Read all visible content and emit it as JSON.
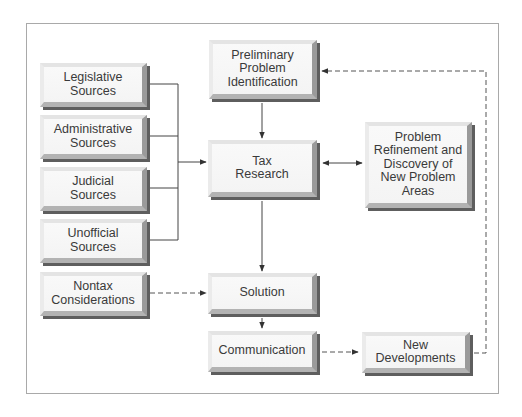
{
  "diagram": {
    "title": "",
    "nodes": {
      "legislative": {
        "label": "Legislative\nSources"
      },
      "administrative": {
        "label": "Administrative\nSources"
      },
      "judicial": {
        "label": "Judicial\nSources"
      },
      "unofficial": {
        "label": "Unofficial\nSources"
      },
      "nontax": {
        "label": "Nontax\nConsiderations"
      },
      "preliminary": {
        "label": "Preliminary\nProblem\nIdentification"
      },
      "tax_research": {
        "label": "Tax\nResearch"
      },
      "refinement": {
        "label": "Problem\nRefinement and\nDiscovery of\nNew Problem\nAreas"
      },
      "solution": {
        "label": "Solution"
      },
      "communication": {
        "label": "Communication"
      },
      "new_developments": {
        "label": "New\nDevelopments"
      }
    },
    "edges": [
      {
        "from": "legislative",
        "to": "tax_research",
        "style": "solid"
      },
      {
        "from": "administrative",
        "to": "tax_research",
        "style": "solid"
      },
      {
        "from": "judicial",
        "to": "tax_research",
        "style": "solid"
      },
      {
        "from": "unofficial",
        "to": "tax_research",
        "style": "solid"
      },
      {
        "from": "preliminary",
        "to": "tax_research",
        "style": "solid"
      },
      {
        "from": "tax_research",
        "to": "refinement",
        "style": "solid",
        "bidirectional": true
      },
      {
        "from": "tax_research",
        "to": "solution",
        "style": "solid"
      },
      {
        "from": "nontax",
        "to": "solution",
        "style": "dashed"
      },
      {
        "from": "solution",
        "to": "communication",
        "style": "solid"
      },
      {
        "from": "communication",
        "to": "new_developments",
        "style": "dashed"
      },
      {
        "from": "new_developments",
        "to": "preliminary",
        "style": "dashed"
      }
    ],
    "colors": {
      "box_face": "#f6f6f6",
      "box_shadow": "#5e5e5e",
      "line": "#333333",
      "frame": "#a9a9a9",
      "text": "#3a3a3a"
    }
  }
}
